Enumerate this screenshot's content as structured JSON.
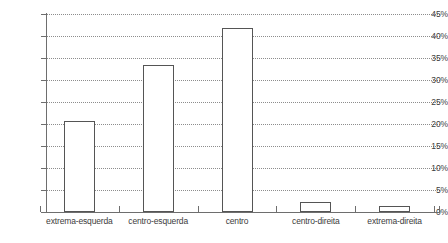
{
  "chart_data": {
    "type": "bar",
    "title": "",
    "subtitle": "",
    "xlabel": "",
    "ylabel": "",
    "categories": [
      "extrema-esquerda",
      "centro-esquerda",
      "centro",
      "centro-direita",
      "extrema-direita"
    ],
    "values": [
      20.7,
      33.5,
      41.8,
      2.2,
      1.3
    ],
    "value_labels": [
      "20,7%",
      "33,5%",
      "41,8%",
      "2,2%",
      "1,3%"
    ],
    "ylim": [
      0,
      45
    ],
    "ytick_values": [
      0,
      5,
      10,
      15,
      20,
      25,
      30,
      35,
      40,
      45
    ],
    "ytick_labels": [
      "0%",
      "5%",
      "10%",
      "15%",
      "20%",
      "25%",
      "30%",
      "35%",
      "40%",
      "45%"
    ],
    "grid": true,
    "grid_axis": "y",
    "grid_style": "dotted",
    "legend": false,
    "legend_position": "none",
    "bar_fill": "#ffffff",
    "bar_border": "#555555",
    "grid_color": "#8d8d8d",
    "axis_color": "#6e6e6e",
    "text_color": "#3c3c3c",
    "background": "#ffffff"
  }
}
